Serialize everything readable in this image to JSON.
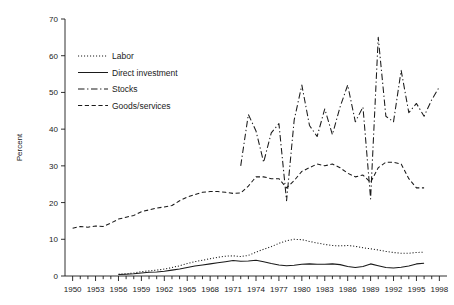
{
  "chart_data": {
    "type": "line",
    "title": "",
    "xlabel": "",
    "ylabel": "Percent",
    "xlim": [
      1949,
      1999
    ],
    "ylim": [
      0,
      70
    ],
    "ytick_step": 10,
    "yticks": [
      0,
      10,
      20,
      30,
      40,
      50,
      60,
      70
    ],
    "xticks_labeled": [
      1950,
      1953,
      1956,
      1959,
      1962,
      1965,
      1968,
      1971,
      1974,
      1977,
      1980,
      1983,
      1986,
      1989,
      1992,
      1995,
      1998
    ],
    "xtick_minor_step": 1,
    "grid": false,
    "legend_position": "upper-left-inside",
    "series": [
      {
        "name": "Labor",
        "style": "dotted",
        "color": "#1a1a1a",
        "x": [
          1956,
          1957,
          1958,
          1959,
          1960,
          1961,
          1962,
          1963,
          1964,
          1965,
          1966,
          1967,
          1968,
          1969,
          1970,
          1971,
          1972,
          1973,
          1974,
          1975,
          1976,
          1977,
          1978,
          1979,
          1980,
          1981,
          1982,
          1983,
          1984,
          1985,
          1986,
          1987,
          1988,
          1989,
          1990,
          1991,
          1992,
          1993,
          1994,
          1995,
          1996
        ],
        "values": [
          0.5,
          0.6,
          0.8,
          1.2,
          1.4,
          1.6,
          1.9,
          2.3,
          2.8,
          3.4,
          3.9,
          4.3,
          4.7,
          5.1,
          5.4,
          5.5,
          5.3,
          5.6,
          6.5,
          7.3,
          8.0,
          8.9,
          9.6,
          10.0,
          9.9,
          9.4,
          9.0,
          8.6,
          8.3,
          8.2,
          8.3,
          8.1,
          7.7,
          7.4,
          7.1,
          6.7,
          6.4,
          6.2,
          6.2,
          6.4,
          6.5
        ]
      },
      {
        "name": "Direct investment",
        "style": "solid",
        "color": "#1a1a1a",
        "x": [
          1956,
          1957,
          1958,
          1959,
          1960,
          1961,
          1962,
          1963,
          1964,
          1965,
          1966,
          1967,
          1968,
          1969,
          1970,
          1971,
          1972,
          1973,
          1974,
          1975,
          1976,
          1977,
          1978,
          1979,
          1980,
          1981,
          1982,
          1983,
          1984,
          1985,
          1986,
          1987,
          1988,
          1989,
          1990,
          1991,
          1992,
          1993,
          1994,
          1995,
          1996
        ],
        "values": [
          0.4,
          0.5,
          0.6,
          0.8,
          1.0,
          1.1,
          1.3,
          1.6,
          1.9,
          2.3,
          2.7,
          3.0,
          3.3,
          3.6,
          3.9,
          4.2,
          4.0,
          4.1,
          4.3,
          3.9,
          3.4,
          3.0,
          2.8,
          2.9,
          3.2,
          3.3,
          3.2,
          3.2,
          3.3,
          3.1,
          2.6,
          2.3,
          2.6,
          3.3,
          2.8,
          2.3,
          2.2,
          2.4,
          2.7,
          3.3,
          3.5
        ]
      },
      {
        "name": "Stocks",
        "style": "dashdot",
        "color": "#1a1a1a",
        "x": [
          1972,
          1973,
          1974,
          1975,
          1976,
          1977,
          1978,
          1979,
          1980,
          1981,
          1982,
          1983,
          1984,
          1985,
          1986,
          1987,
          1988,
          1989,
          1990,
          1991,
          1992,
          1993,
          1994,
          1995,
          1996,
          1997,
          1998
        ],
        "values": [
          30.0,
          44.0,
          39.5,
          31.0,
          39.0,
          41.5,
          20.5,
          42.5,
          52.0,
          41.0,
          38.0,
          45.5,
          38.5,
          46.0,
          52.0,
          42.0,
          46.0,
          21.0,
          65.0,
          43.5,
          42.0,
          56.0,
          44.5,
          47.0,
          43.5,
          48.0,
          51.5
        ]
      },
      {
        "name": "Goods/services",
        "style": "dashed",
        "color": "#1a1a1a",
        "x": [
          1950,
          1951,
          1952,
          1953,
          1954,
          1955,
          1956,
          1957,
          1958,
          1959,
          1960,
          1961,
          1962,
          1963,
          1964,
          1965,
          1966,
          1967,
          1968,
          1969,
          1970,
          1971,
          1972,
          1973,
          1974,
          1975,
          1976,
          1977,
          1978,
          1979,
          1980,
          1981,
          1982,
          1983,
          1984,
          1985,
          1986,
          1987,
          1988,
          1989,
          1990,
          1991,
          1992,
          1993,
          1994,
          1995,
          1996
        ],
        "values": [
          13.0,
          13.5,
          13.3,
          13.6,
          13.5,
          14.4,
          15.5,
          16.0,
          16.5,
          17.5,
          18.0,
          18.5,
          18.8,
          19.2,
          20.5,
          21.5,
          22.2,
          22.8,
          23.0,
          23.0,
          22.8,
          22.5,
          22.6,
          24.5,
          27.0,
          27.0,
          26.5,
          26.5,
          24.0,
          26.0,
          28.5,
          29.5,
          30.5,
          30.0,
          30.5,
          29.5,
          28.0,
          27.0,
          27.5,
          25.5,
          29.5,
          31.0,
          31.0,
          30.5,
          26.5,
          24.0,
          24.0
        ]
      }
    ]
  },
  "legend": {
    "items": [
      {
        "label": "Labor",
        "style": "dotted"
      },
      {
        "label": "Direct investment",
        "style": "solid"
      },
      {
        "label": "Stocks",
        "style": "dashdot"
      },
      {
        "label": "Goods/services",
        "style": "dashed"
      }
    ]
  },
  "axis": {
    "y_title": "Percent"
  }
}
